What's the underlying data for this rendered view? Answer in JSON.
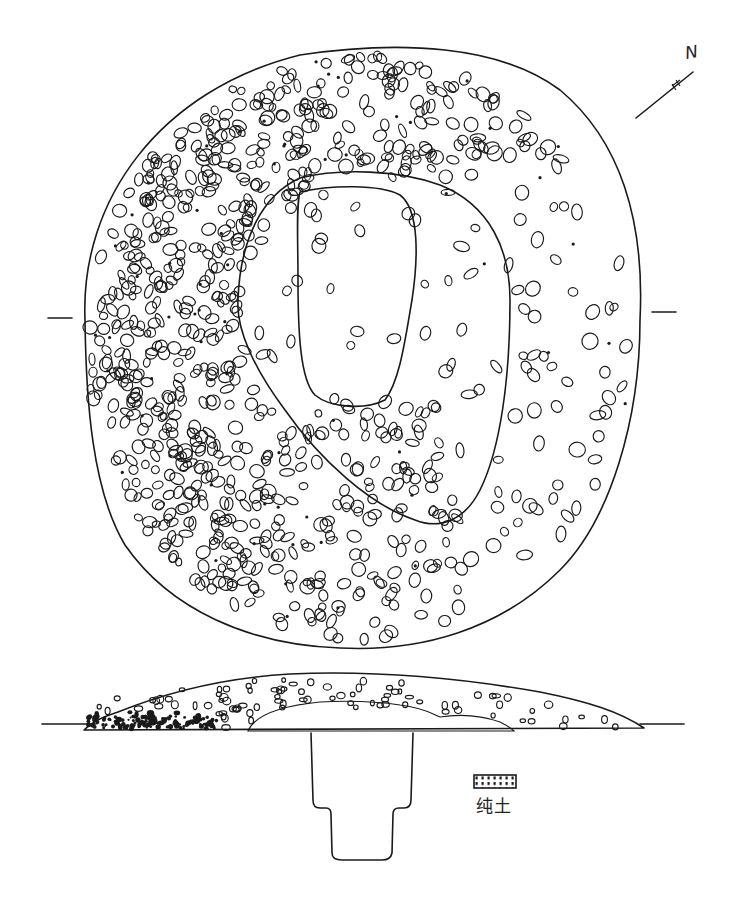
{
  "figure": {
    "type": "archaeological tumulus plan and section drawing",
    "plan_view": {
      "outer_boundary": "circular stone mound",
      "middle_boundary": "rounded triangular stone ring",
      "inner_boundary": "rounded rectangular pit outline",
      "section_line_ticks": [
        "left",
        "right"
      ]
    },
    "section_view": {
      "ground_line": "horizontal",
      "fill_layers": [
        "stone fill",
        "pure soil (hatched)"
      ],
      "pit_shape": "stepped shaft"
    }
  },
  "north_arrow": {
    "label": "N"
  },
  "legend": {
    "items": [
      {
        "symbol": "hatched-box",
        "label": "纯土"
      }
    ]
  }
}
